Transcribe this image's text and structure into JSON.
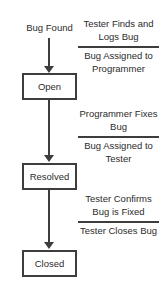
{
  "diagram": {
    "entry": {
      "label": "Bug Found"
    },
    "states": [
      {
        "id": "open",
        "label": "Open"
      },
      {
        "id": "resolved",
        "label": "Resolved"
      },
      {
        "id": "closed",
        "label": "Closed"
      }
    ],
    "annotations": [
      {
        "above": "Tester Finds and Logs Bug",
        "below": "Bug Assigned to Programmer"
      },
      {
        "above": "Programmer Fixes Bug",
        "below": "Bug Assigned to Tester"
      },
      {
        "above": "Tester Confirms Bug is Fixed",
        "below": "Tester Closes Bug"
      }
    ],
    "transitions": [
      {
        "id": "entry-to-open",
        "from": "Bug Found",
        "to": "Open"
      },
      {
        "id": "open-to-resolved",
        "from": "Open",
        "to": "Resolved"
      },
      {
        "id": "resolved-to-closed",
        "from": "Resolved",
        "to": "Closed"
      }
    ],
    "colors": {
      "background": "#ffffff",
      "stroke": "#3d3d3d",
      "text": "#2b2b2b"
    }
  }
}
